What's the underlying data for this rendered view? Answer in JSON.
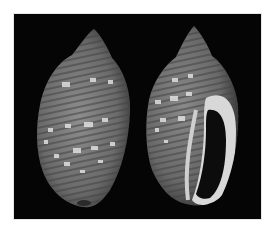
{
  "image": {
    "subject": "two-seashells-photo",
    "background_color": "#050505",
    "page_color": "#ffffff",
    "shells": [
      {
        "view": "dorsal",
        "position": "left"
      },
      {
        "view": "apertural",
        "position": "right"
      }
    ]
  }
}
